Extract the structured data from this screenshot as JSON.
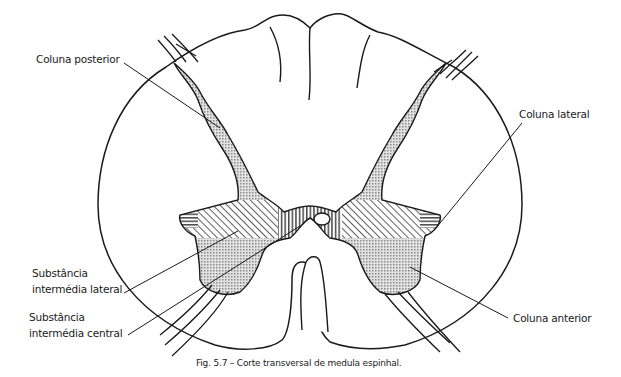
{
  "figure": {
    "caption": "Fig. 5.7 – Corte transversal de medula espinhal.",
    "labels": {
      "coluna_posterior": "Coluna posterior",
      "coluna_lateral": "Coluna lateral",
      "substancia_lateral_l1": "Substância",
      "substancia_lateral_l2": "intermédia lateral",
      "substancia_central_l1": "Substância",
      "substancia_central_l2": "intermédia central",
      "coluna_anterior": "Coluna anterior"
    },
    "colors": {
      "stroke": "#1a1a1a",
      "gray_matter": "#c8c8c8"
    }
  }
}
